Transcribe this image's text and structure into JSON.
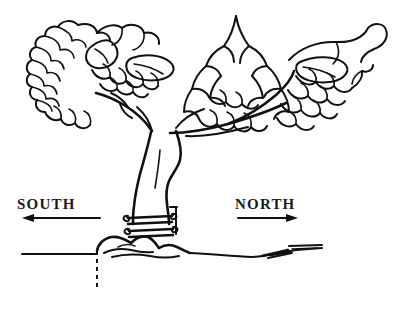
{
  "figure": {
    "background_color": "#ffffff",
    "ink_color": "#111111",
    "width": 408,
    "height": 313
  },
  "labels": {
    "south": "SOUTH",
    "north": "NORTH"
  },
  "annotations": {
    "south_arrow_name": "south-direction-arrow",
    "north_arrow_name": "north-direction-arrow",
    "ground_line_name": "ground-line",
    "reference_line_name": "dashed-reference-line"
  },
  "parts": {
    "canopy": "tree-canopy-foliage",
    "trunk": "tree-trunk",
    "branches": "tree-branches",
    "wrap_bands": "trunk-wrap-bands",
    "root_flare": "root-flare",
    "soil_hatching": "soil-surface-hatching"
  }
}
